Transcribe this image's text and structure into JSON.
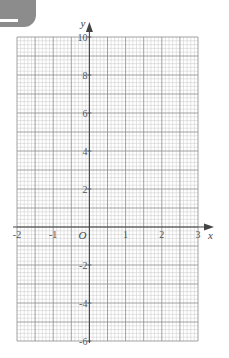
{
  "chart_data": {
    "type": "line",
    "title": "",
    "xlabel": "x",
    "ylabel": "y",
    "origin_label": "O",
    "xlim": [
      -2,
      3
    ],
    "ylim": [
      -6,
      10
    ],
    "x_ticks": [
      -2,
      -1,
      1,
      2,
      3
    ],
    "x_tick_labels": [
      "-2",
      "-1",
      "1",
      "2",
      "3"
    ],
    "y_ticks": [
      10,
      8,
      6,
      4,
      2,
      -2,
      -4,
      -6
    ],
    "y_tick_labels": [
      "10",
      "8",
      "6",
      "4",
      "2",
      "-2",
      "-4",
      "-6"
    ],
    "grid": true,
    "grid_minor_per_x_unit": 10,
    "grid_minor_per_y_unit": 5,
    "series": []
  },
  "colors": {
    "tab": "#8c8c8c",
    "minor_grid": "#c8c8c8",
    "major_grid": "#8a8a8a",
    "axis": "#444444"
  }
}
